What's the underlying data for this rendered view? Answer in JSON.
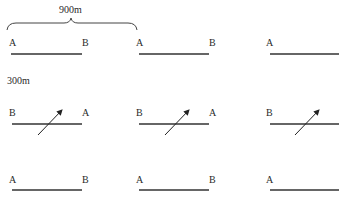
{
  "annotations": {
    "width_label": "900m",
    "height_label": "300m"
  },
  "rows": [
    {
      "cells": [
        {
          "left": "A",
          "right": "B",
          "arrow": false
        },
        {
          "left": "A",
          "right": "B",
          "arrow": false
        },
        {
          "left": "A",
          "right": "",
          "arrow": false
        }
      ]
    },
    {
      "cells": [
        {
          "left": "B",
          "right": "A",
          "arrow": true
        },
        {
          "left": "B",
          "right": "A",
          "arrow": true
        },
        {
          "left": "B",
          "right": "",
          "arrow": true
        }
      ]
    },
    {
      "cells": [
        {
          "left": "A",
          "right": "B",
          "arrow": false
        },
        {
          "left": "A",
          "right": "B",
          "arrow": false
        },
        {
          "left": "A",
          "right": "",
          "arrow": false
        }
      ]
    }
  ],
  "colors": {
    "line": "#333333",
    "text": "#2a2a2a"
  }
}
